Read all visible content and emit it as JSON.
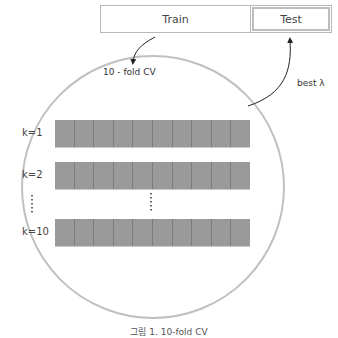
{
  "split": {
    "train_label": "Train",
    "test_label": "Test"
  },
  "arrows": {
    "cv_label": "10 - fold CV",
    "best_label": "best λ"
  },
  "folds": {
    "rows": [
      {
        "label": "k=1",
        "cells": 10
      },
      {
        "label": "k=2",
        "cells": 10
      },
      {
        "label": "k=10",
        "cells": 10
      }
    ],
    "ellipsis": "⋮"
  },
  "colors": {
    "cell": "#9a9a9a",
    "cell_border": "#7c7c7c",
    "circle": "#c0c0c0"
  },
  "caption": "그림 1. 10-fold CV"
}
